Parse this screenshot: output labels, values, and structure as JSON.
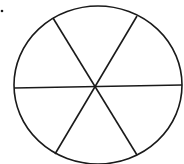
{
  "diagram": {
    "shape": "circle",
    "sectors": 6,
    "stroke_color": "#1a1a1a",
    "background": "#ffffff",
    "marker_dot": {
      "x": 2,
      "y": 11
    },
    "circle": {
      "cx": 98,
      "cy": 85,
      "rx": 84,
      "ry": 79
    },
    "center": {
      "x": 95,
      "y": 87
    },
    "spokes": [
      {
        "name": "horizontal-diameter",
        "x1": 14,
        "y1": 88,
        "x2": 182,
        "y2": 85
      },
      {
        "name": "diagonal-diameter-a",
        "x1": 53,
        "y1": 18,
        "x2": 137,
        "y2": 155
      },
      {
        "name": "diagonal-diameter-b",
        "x1": 137,
        "y1": 16,
        "x2": 55,
        "y2": 154
      }
    ]
  }
}
